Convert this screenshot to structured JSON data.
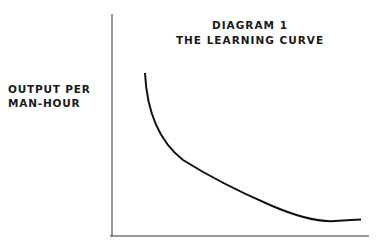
{
  "diagram": {
    "title_line1": "DIAGRAM 1",
    "title_line2": "THE LEARNING CURVE",
    "ylabel_line1": "OUTPUT PER",
    "ylabel_line2": "MAN-HOUR",
    "xlabel": "",
    "curve_shape": "decreasing convex curve flattening out"
  }
}
